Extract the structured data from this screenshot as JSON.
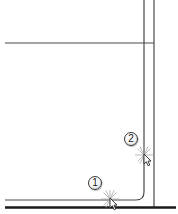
{
  "diagram": {
    "type": "cad-fillet-illustration",
    "colors": {
      "background": "#ffffff",
      "thin_line": "#4a4a4a",
      "thick_line": "#1a1a1a",
      "spark": "#9a9a9a",
      "cursor": "#2a2a2a"
    },
    "lines": [
      {
        "id": "horizontal-top",
        "x1": 5,
        "y1": 43,
        "x2": 154,
        "y2": 43,
        "weight": "thin"
      },
      {
        "id": "vertical-inner",
        "x1": 144,
        "y1": 0,
        "x2": 144,
        "y2": 192,
        "weight": "thin",
        "note": "filleted into bottom inner line"
      },
      {
        "id": "vertical-outer",
        "x1": 154,
        "y1": 0,
        "x2": 154,
        "y2": 207,
        "weight": "thin"
      },
      {
        "id": "horizontal-inner-bottom",
        "x1": 5,
        "y1": 200,
        "x2": 136,
        "y2": 200,
        "weight": "thin"
      },
      {
        "id": "horizontal-thick-bottom",
        "x1": 5,
        "y1": 207,
        "x2": 176,
        "y2": 207,
        "weight": "thick"
      }
    ],
    "fillet": {
      "corner_x": 144,
      "corner_y": 200,
      "radius": 8
    },
    "steps": [
      {
        "label": "1",
        "marker_x": 95,
        "marker_y": 183,
        "pick_x": 111,
        "pick_y": 199
      },
      {
        "label": "2",
        "marker_x": 131,
        "marker_y": 139,
        "pick_x": 144,
        "pick_y": 155
      }
    ]
  }
}
